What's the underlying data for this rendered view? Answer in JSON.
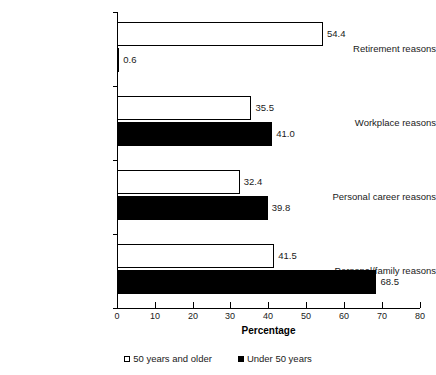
{
  "chart_data": {
    "type": "bar",
    "orientation": "horizontal",
    "title": "",
    "xlabel": "Percentage",
    "ylabel": "",
    "xlim": [
      0,
      80
    ],
    "xticks": [
      0,
      10,
      20,
      30,
      40,
      50,
      60,
      70,
      80
    ],
    "grid": false,
    "legend_position": "bottom",
    "categories": [
      "Retirement reasons",
      "Workplace reasons",
      "Personal career reasons",
      "Personal/family reasons"
    ],
    "series": [
      {
        "name": "50 years and older",
        "style": "open",
        "color": "#ffffff",
        "edge_color": "#000000",
        "values": [
          54.4,
          35.5,
          32.4,
          41.5
        ],
        "labels": [
          "54.4",
          "35.5",
          "32.4",
          "41.5"
        ]
      },
      {
        "name": "Under 50 years",
        "style": "solid",
        "color": "#000000",
        "edge_color": "#000000",
        "values": [
          0.6,
          41.0,
          39.8,
          68.5
        ],
        "labels": [
          "0.6",
          "41.0",
          "39.8",
          "68.5"
        ]
      }
    ]
  },
  "axis": {
    "x_tick_labels": [
      "0",
      "10",
      "20",
      "30",
      "40",
      "50",
      "60",
      "70",
      "80"
    ],
    "x_title": "Percentage"
  },
  "legend": {
    "items": [
      {
        "label": "50 years and older",
        "swatch": "open-square-icon"
      },
      {
        "label": "Under 50 years",
        "swatch": "filled-square-icon"
      }
    ]
  }
}
